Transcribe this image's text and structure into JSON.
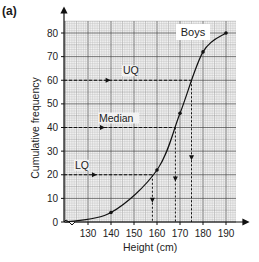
{
  "part_label": "(a)",
  "chart_data": {
    "type": "line",
    "title": "",
    "series_label": "Boys",
    "xlabel": "Height (cm)",
    "ylabel": "Cumulative frequency",
    "xlim": [
      120,
      195
    ],
    "ylim": [
      0,
      85
    ],
    "x_ticks": [
      130,
      140,
      150,
      160,
      170,
      180,
      190
    ],
    "y_ticks": [
      0,
      10,
      20,
      30,
      40,
      50,
      60,
      70,
      80
    ],
    "grid": true,
    "series": [
      {
        "name": "Boys",
        "x": [
          120,
          140,
          160,
          170,
          180,
          190
        ],
        "values": [
          0,
          4,
          22,
          46,
          72,
          80
        ]
      }
    ],
    "annotations": [
      {
        "label": "UQ",
        "y": 60,
        "x": 175
      },
      {
        "label": "Median",
        "y": 40,
        "x": 168
      },
      {
        "label": "LQ",
        "y": 20,
        "x": 158
      }
    ]
  }
}
